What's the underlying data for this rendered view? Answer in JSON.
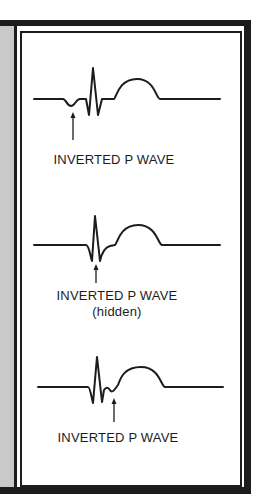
{
  "figure": {
    "panels": [
      {
        "label": "INVERTED P WAVE",
        "sublabel": ""
      },
      {
        "label": "INVERTED P WAVE",
        "sublabel": "(hidden)"
      },
      {
        "label": "INVERTED P WAVE",
        "sublabel": ""
      }
    ],
    "colors": {
      "ink": "#1c1c1c",
      "side_strip": "#c9c9c9",
      "background": "#ffffff"
    }
  }
}
